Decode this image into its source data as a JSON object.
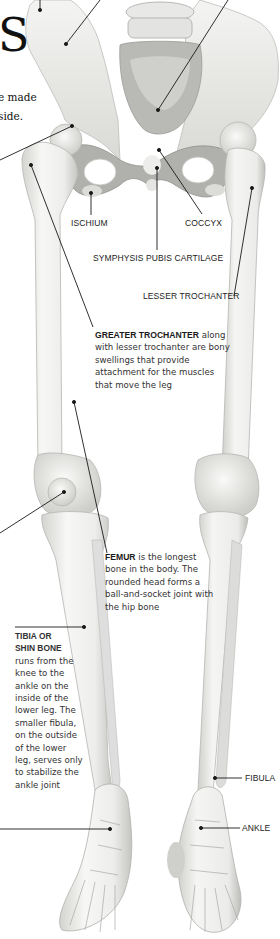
{
  "title": {
    "fragment": "S"
  },
  "intro": {
    "line1": "e made",
    "line2": "side."
  },
  "labels": {
    "ischium": "ISCHIUM",
    "coccyx": "COCCYX",
    "symphysis": "SYMPHYSIS PUBIS CARTILAGE",
    "lesser_trochanter": "LESSER TROCHANTER",
    "fibula": "FIBULA",
    "ankle": "ANKLE"
  },
  "descriptions": {
    "greater_trochanter": {
      "term": "GREATER TROCHANTER",
      "text": " along with lesser trochanter are bony swellings that provide attachment for the muscles that move the leg"
    },
    "femur": {
      "term": "FEMUR",
      "text": " is the longest bone in the body. The rounded head forms a ball-and-socket joint with the hip bone"
    },
    "tibia": {
      "term_line1": "TIBIA OR",
      "term_line2": "SHIN BONE",
      "text": "runs from the knee to the ankle on the inside of the lower leg. The smaller fibula, on the outside of the lower leg, serves only to stabilize the ankle joint"
    }
  },
  "colors": {
    "bone": "#f2f2f0",
    "bone_shadow": "#c9c9c6",
    "pelvis_shadow": "#8f8f8c",
    "leader_line": "#1a1a1a",
    "text": "#222222"
  }
}
